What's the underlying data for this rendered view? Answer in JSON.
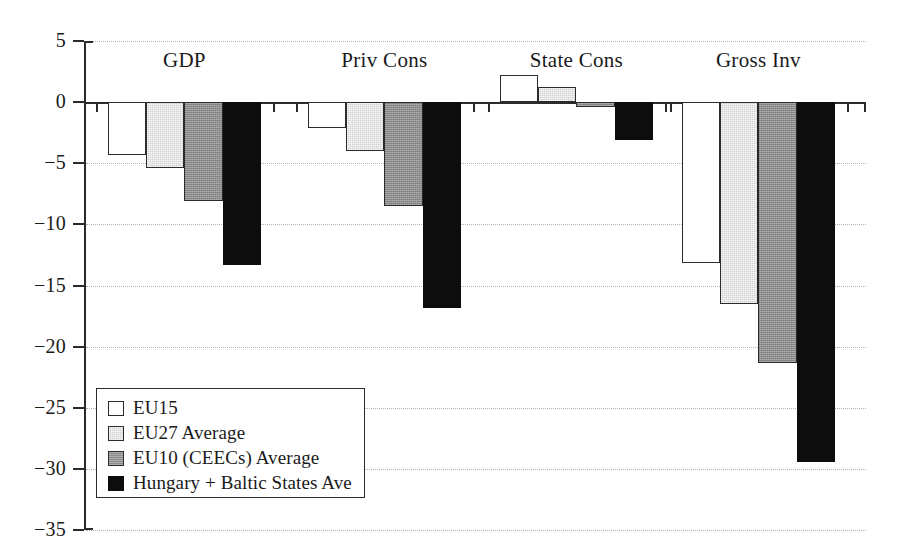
{
  "chart_data": {
    "type": "bar",
    "title": "",
    "xlabel": "",
    "ylabel": "",
    "ylim": [
      -35,
      5
    ],
    "ytick_step": 5,
    "grid": true,
    "grid_style": "dotted-horizontal",
    "orientation": "vertical",
    "bar_style": "grouped-contiguous",
    "legend_position": "inside-bottom-left",
    "categories": [
      "GDP",
      "Priv Cons",
      "State Cons",
      "Gross Inv"
    ],
    "ytick_labels": [
      "5",
      "0",
      "−5",
      "−10",
      "−15",
      "−20",
      "−25",
      "−30",
      "−35"
    ],
    "ytick_values": [
      5,
      0,
      -5,
      -10,
      -15,
      -20,
      -25,
      -30,
      -35
    ],
    "series": [
      {
        "name": "EU15",
        "fill": "#ffffff",
        "values": [
          -4.3,
          -2.1,
          2.2,
          -13.2
        ]
      },
      {
        "name": "EU27 Average",
        "fill": "#d2d2d2",
        "values": [
          -5.4,
          -4.0,
          1.2,
          -16.5
        ]
      },
      {
        "name": "EU10 (CEECs) Average",
        "fill": "#8c8c8c",
        "values": [
          -8.1,
          -8.5,
          -0.4,
          -21.3
        ]
      },
      {
        "name": "Hungary + Baltic States Ave",
        "fill": "#0d0d0d",
        "values": [
          -13.3,
          -16.8,
          -3.1,
          -29.4
        ]
      }
    ]
  },
  "legend": {
    "items": [
      {
        "label": "EU15"
      },
      {
        "label": "EU27 Average"
      },
      {
        "label": "EU10 (CEECs) Average"
      },
      {
        "label": "Hungary + Baltic States Ave"
      }
    ]
  },
  "axis": {
    "colors": {
      "axis_line": "#2b2b2b",
      "gridline": "#b4b4b4",
      "text": "#1a1a1a"
    }
  }
}
